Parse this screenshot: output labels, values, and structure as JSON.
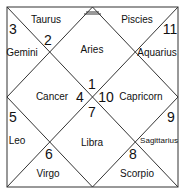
{
  "chart": {
    "type": "north-indian-horoscope",
    "line_color": "#333333",
    "houses": [
      {
        "house": 1,
        "number": "1",
        "sign": "Aries"
      },
      {
        "house": 2,
        "number": "2",
        "sign": "Taurus"
      },
      {
        "house": 3,
        "number": "3",
        "sign": "Gemini"
      },
      {
        "house": 4,
        "number": "4",
        "sign": "Cancer"
      },
      {
        "house": 5,
        "number": "5",
        "sign": "Leo"
      },
      {
        "house": 6,
        "number": "6",
        "sign": "Virgo"
      },
      {
        "house": 7,
        "number": "7",
        "sign": "Libra"
      },
      {
        "house": 8,
        "number": "8",
        "sign": "Scorpio"
      },
      {
        "house": 9,
        "number": "9",
        "sign": "Sagittarius"
      },
      {
        "house": 10,
        "number": "10",
        "sign": "Capricorn"
      },
      {
        "house": 11,
        "number": "11",
        "sign": "Aquarius"
      },
      {
        "house": 12,
        "number": "12",
        "sign": "Piscies"
      }
    ]
  }
}
